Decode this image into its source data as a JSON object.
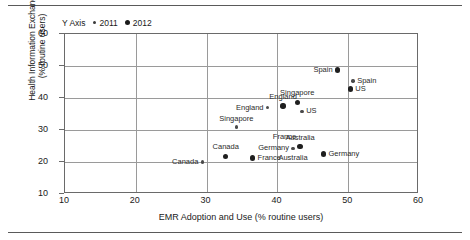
{
  "figure": {
    "has_top_rule": true,
    "has_bottom_rule": true
  },
  "legend": {
    "title": "Y Axis",
    "entries": [
      {
        "label": "2011",
        "marker": "small-dot-icon",
        "size": "small"
      },
      {
        "label": "2012",
        "marker": "large-dot-icon",
        "size": "large"
      }
    ]
  },
  "chart_data": {
    "type": "scatter",
    "title": "",
    "xlabel": "EMR Adoption and Use (% routine users)",
    "ylabel": "Health Information Exchange\n(% routine users)",
    "ylabel_line1": "Health Information Exchange",
    "ylabel_line2": "(% routine users)",
    "xlim": [
      10,
      60
    ],
    "ylim": [
      10,
      60
    ],
    "xticks": [
      10,
      20,
      30,
      40,
      50,
      60
    ],
    "yticks": [
      10,
      20,
      30,
      40,
      50,
      60
    ],
    "grid": true,
    "legend_position": "top-left-outside",
    "series": [
      {
        "name": "2011",
        "marker": "small",
        "points": [
          {
            "label": "Canada",
            "x": 29.4,
            "y": 20.0,
            "label_pos": "left"
          },
          {
            "label": "Singapore",
            "x": 34.2,
            "y": 31.0,
            "label_pos": "above"
          },
          {
            "label": "England",
            "x": 38.6,
            "y": 37.0,
            "label_pos": "left"
          },
          {
            "label": "Germany",
            "x": 42.2,
            "y": 24.3,
            "label_pos": "left"
          },
          {
            "label": "US",
            "x": 43.5,
            "y": 35.8,
            "label_pos": "right"
          },
          {
            "label": "Spain",
            "x": 50.7,
            "y": 45.3,
            "label_pos": "right"
          }
        ]
      },
      {
        "name": "2012",
        "marker": "large",
        "points": [
          {
            "label": "France",
            "x": 36.5,
            "y": 21.3,
            "label_pos": "right"
          },
          {
            "label": "Canada",
            "x": 32.7,
            "y": 21.8,
            "label_pos": "above"
          },
          {
            "label": "England",
            "x": 40.8,
            "y": 37.5,
            "label_pos": "above"
          },
          {
            "label": "Singapore",
            "x": 42.8,
            "y": 38.6,
            "label_pos": "above"
          },
          {
            "label": "Australia",
            "x": 43.2,
            "y": 24.8,
            "label_pos": "above"
          },
          {
            "label": "Germany",
            "x": 46.5,
            "y": 22.5,
            "label_pos": "right"
          },
          {
            "label": "Spain",
            "x": 48.5,
            "y": 48.7,
            "label_pos": "left"
          },
          {
            "label": "US",
            "x": 50.3,
            "y": 42.8,
            "label_pos": "right"
          }
        ]
      }
    ],
    "annotations": [
      {
        "text": "France",
        "x": 41.0,
        "y": 26.6
      },
      {
        "text": "Australia",
        "x": 42.2,
        "y": 19.9
      }
    ]
  }
}
